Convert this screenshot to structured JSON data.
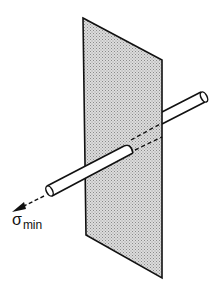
{
  "diagram": {
    "labels": {
      "stress_symbol": "σ",
      "stress_subscript": "min"
    },
    "colors": {
      "line": "#111111",
      "plane_fill": "#c9c9c9",
      "background": "#ffffff"
    },
    "elements": [
      {
        "id": "fracture-plane",
        "type": "shaded-parallelogram"
      },
      {
        "id": "rod-front",
        "type": "cylinder",
        "note": "in front of plane, lower-left"
      },
      {
        "id": "rod-hidden",
        "type": "dashed-cylinder",
        "note": "portion behind plane surface"
      },
      {
        "id": "rod-back",
        "type": "cylinder",
        "note": "emerging behind plane, upper-right"
      },
      {
        "id": "stress-arrow",
        "type": "dashed-arrow",
        "label": "σmin"
      }
    ]
  }
}
